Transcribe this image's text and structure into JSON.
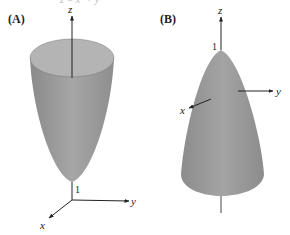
{
  "top_fragment": "z = x² + y²",
  "panels": [
    {
      "label": "(A)",
      "surface": "paraboloid opening upward",
      "axes": {
        "x": "x",
        "y": "y",
        "z": "z"
      },
      "vertex_label": "1"
    },
    {
      "label": "(B)",
      "surface": "paraboloid opening downward",
      "axes": {
        "x": "x",
        "y": "y",
        "z": "z"
      },
      "vertex_label": "1"
    }
  ],
  "colors": {
    "surface": "#9a9a9a",
    "surface_rim": "#b8b8b8",
    "axis": "#222222"
  }
}
